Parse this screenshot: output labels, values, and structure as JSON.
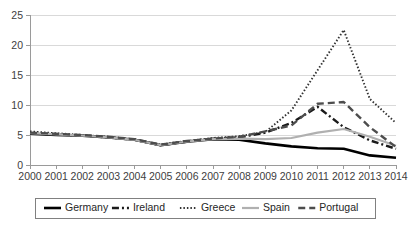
{
  "chart_data": {
    "type": "line",
    "title": "",
    "xlabel": "",
    "ylabel": "",
    "xlim": [
      2000,
      2014
    ],
    "ylim": [
      0,
      25
    ],
    "ytick_step": 5,
    "grid": true,
    "legend_position": "bottom",
    "categories": [
      "2000",
      "2001",
      "2002",
      "2003",
      "2004",
      "2005",
      "2006",
      "2007",
      "2008",
      "2009",
      "2010",
      "2011",
      "2012",
      "2013",
      "2014"
    ],
    "x": [
      2000,
      2001,
      2002,
      2003,
      2004,
      2005,
      2006,
      2007,
      2008,
      2009,
      2010,
      2011,
      2012,
      2013,
      2014
    ],
    "yticks": [
      0,
      5,
      10,
      15,
      20,
      25
    ],
    "ytick_labels": [
      "0",
      "5",
      "10",
      "15",
      "20",
      "25"
    ],
    "series": [
      {
        "name": "Germany",
        "color": "#000000",
        "style": "solid",
        "dasharray": "",
        "width": 2.6,
        "values": [
          5.2,
          5.0,
          4.9,
          4.6,
          4.2,
          3.3,
          3.9,
          4.3,
          4.2,
          3.6,
          3.1,
          2.8,
          2.7,
          1.6,
          1.2
        ]
      },
      {
        "name": "Ireland",
        "color": "#1a1a1a",
        "style": "dash-dot",
        "dasharray": "7,3,2,3",
        "width": 2.4,
        "values": [
          5.3,
          5.1,
          4.9,
          4.6,
          4.2,
          3.3,
          3.9,
          4.4,
          4.6,
          5.4,
          7.0,
          9.7,
          6.3,
          4.1,
          2.7
        ]
      },
      {
        "name": "Greece",
        "color": "#333333",
        "style": "dotted",
        "dasharray": "1.5,2",
        "width": 1.9,
        "values": [
          5.6,
          5.3,
          5.0,
          4.7,
          4.3,
          3.4,
          4.0,
          4.5,
          4.8,
          5.5,
          9.1,
          15.8,
          22.5,
          11.0,
          7.0
        ]
      },
      {
        "name": "Spain",
        "color": "#b0b0b0",
        "style": "solid",
        "dasharray": "",
        "width": 2.2,
        "values": [
          5.3,
          5.1,
          4.9,
          4.6,
          4.2,
          3.3,
          3.9,
          4.3,
          4.4,
          4.3,
          4.5,
          5.4,
          6.0,
          4.7,
          3.2
        ]
      },
      {
        "name": "Portugal",
        "color": "#4d4d4d",
        "style": "dashed",
        "dasharray": "7,4",
        "width": 2.4,
        "values": [
          5.4,
          5.2,
          5.0,
          4.7,
          4.3,
          3.4,
          4.0,
          4.4,
          4.7,
          5.6,
          6.6,
          10.2,
          10.5,
          6.3,
          3.0
        ]
      }
    ]
  },
  "legend": {
    "items": [
      {
        "label": "Germany"
      },
      {
        "label": "Ireland"
      },
      {
        "label": "Greece"
      },
      {
        "label": "Spain"
      },
      {
        "label": "Portugal"
      }
    ]
  }
}
